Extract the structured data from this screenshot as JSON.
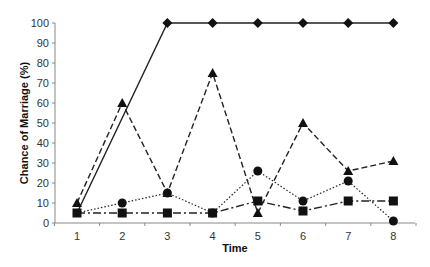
{
  "chart_data": {
    "type": "line",
    "title": "",
    "xlabel": "Time",
    "ylabel": "Chance of Marriage (%)",
    "x": [
      1,
      2,
      3,
      4,
      5,
      6,
      7,
      8
    ],
    "xticks": [
      "1",
      "2",
      "3",
      "4",
      "5",
      "6",
      "7",
      "8"
    ],
    "yticks": [
      "0",
      "10",
      "20",
      "30",
      "40",
      "50",
      "60",
      "70",
      "80",
      "90",
      "100"
    ],
    "ylim": [
      0,
      100
    ],
    "grid": false,
    "legend": null,
    "series": [
      {
        "name": "diamond-solid",
        "marker": "diamond",
        "line": "solid",
        "values": [
          5,
          null,
          100,
          100,
          100,
          100,
          100,
          100
        ]
      },
      {
        "name": "triangle-dashed",
        "marker": "triangle",
        "line": "dashed",
        "values": [
          10,
          60,
          15,
          75,
          5,
          50,
          26,
          31
        ]
      },
      {
        "name": "circle-dotted",
        "marker": "circle",
        "line": "dotted",
        "values": [
          5,
          10,
          15,
          5,
          26,
          11,
          21,
          1
        ]
      },
      {
        "name": "square-dashdot",
        "marker": "square",
        "line": "dashdot",
        "values": [
          5,
          5,
          5,
          5,
          11,
          6,
          11,
          11
        ]
      }
    ]
  }
}
